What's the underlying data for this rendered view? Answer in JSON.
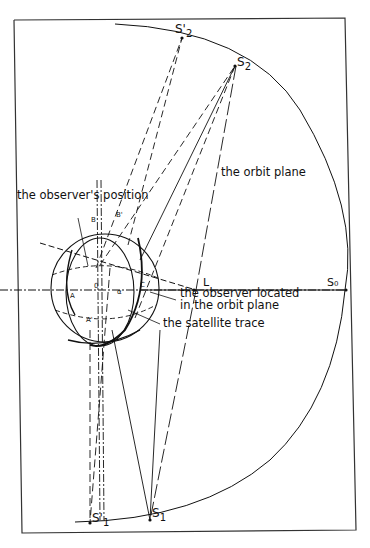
{
  "figure": {
    "page_number": "",
    "labels": {
      "observer_position": "the observer's position",
      "orbit_plane": "the orbit plane",
      "observer_in_orbit_line1": "the observer located",
      "observer_in_orbit_line2": "in the orbit plane",
      "satellite_trace": "the satellite trace"
    },
    "points": {
      "S2_prime": "S'",
      "S2_prime_sub": "2",
      "S2": "S",
      "S2_sub": "2",
      "S0": "S₀",
      "S1_prime": "S'",
      "S1_prime_sub": "1",
      "S1": "S",
      "S1_sub": "1",
      "L": "L",
      "B": "B",
      "B_prime": "B'",
      "A": "A",
      "A_prime": "A'",
      "C": "C",
      "O": "0",
      "alpha": "α"
    },
    "colors": {
      "ink": "#111111",
      "paper": "#ffffff",
      "frame": "#333333"
    }
  }
}
